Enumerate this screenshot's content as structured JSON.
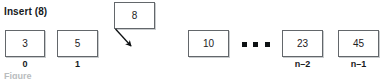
{
  "figure": {
    "operation_label": "Insert (8)",
    "inserted_value": "8",
    "ellipsis": "• • •",
    "caption_partial": "Figure",
    "colors": {
      "cell_border": "#63676b",
      "cell_shadow": "#c9ccce",
      "text": "#1d2124",
      "background": "#ffffff"
    },
    "array_cells": [
      {
        "value": "3",
        "index_label": "0",
        "x": 5,
        "y": 30,
        "w": 40,
        "h": 27
      },
      {
        "value": "5",
        "index_label": "1",
        "x": 57,
        "y": 30,
        "w": 41,
        "h": 27
      },
      {
        "value": "10",
        "index_label": "",
        "x": 188,
        "y": 30,
        "w": 41,
        "h": 27
      },
      {
        "value": "23",
        "index_label": "n–2",
        "x": 282,
        "y": 30,
        "w": 41,
        "h": 27
      },
      {
        "value": "45",
        "index_label": "n–1",
        "x": 338,
        "y": 30,
        "w": 41,
        "h": 27
      }
    ],
    "floating_cell": {
      "value": "8",
      "x": 114,
      "y": 2,
      "w": 41,
      "h": 27
    }
  }
}
